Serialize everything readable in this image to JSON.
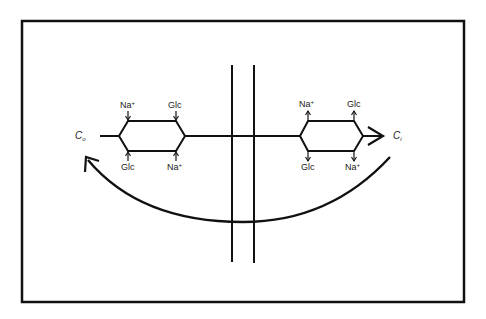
{
  "diagram": {
    "colors": {
      "stroke": "#111111",
      "background": "#ffffff",
      "text": "#222222"
    },
    "outside_label": {
      "main": "C",
      "sub": "o"
    },
    "inside_label": {
      "main": "C",
      "sub": "i"
    },
    "left_carrier": {
      "top_left": {
        "text": "Na",
        "sup": "+"
      },
      "top_right": {
        "text": "Glc",
        "sup": ""
      },
      "bottom_left": {
        "text": "Glc",
        "sup": ""
      },
      "bottom_right": {
        "text": "Na",
        "sup": "+"
      },
      "binding_direction": "inward"
    },
    "right_carrier": {
      "top_left": {
        "text": "Na",
        "sup": "+"
      },
      "top_right": {
        "text": "Glc",
        "sup": ""
      },
      "bottom_left": {
        "text": "Glc",
        "sup": ""
      },
      "bottom_right": {
        "text": "Na",
        "sup": "+"
      },
      "binding_direction": "outward"
    },
    "membrane": {
      "layers": 2
    },
    "return_arrow": "curved arrow from inside back to outside beneath membrane"
  }
}
